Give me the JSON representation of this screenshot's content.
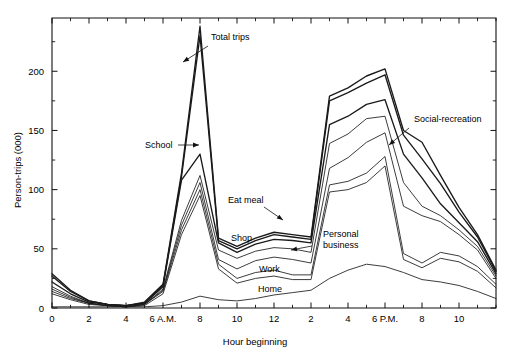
{
  "chart_data": {
    "type": "line",
    "title": "",
    "xlabel": "Hour beginning",
    "ylabel": "Person-trips (000)",
    "xlim": [
      0,
      24
    ],
    "ylim": [
      0,
      245
    ],
    "grid": false,
    "legend_position": "inline-annotations",
    "x": [
      0,
      1,
      2,
      3,
      4,
      5,
      6,
      7,
      8,
      9,
      10,
      11,
      12,
      13,
      14,
      15,
      16,
      17,
      18,
      19,
      20,
      21,
      22,
      23,
      24
    ],
    "x_tick_labels": [
      "0",
      "2",
      "4",
      "6 A.M.",
      "8",
      "10",
      "12",
      "2",
      "4",
      "6 P.M.",
      "8",
      "10"
    ],
    "x_tick_values": [
      0,
      2,
      4,
      6,
      8,
      10,
      12,
      14,
      16,
      18,
      20,
      22
    ],
    "y_tick_labels": [
      "0",
      "50",
      "100",
      "150",
      "200"
    ],
    "y_tick_values": [
      0,
      50,
      100,
      150,
      200
    ],
    "series": [
      {
        "name": "Home",
        "label": "Home",
        "values": [
          1,
          1,
          1,
          1,
          1,
          1,
          2,
          5,
          10,
          7,
          6,
          8,
          11,
          13,
          15,
          25,
          32,
          37,
          35,
          30,
          24,
          22,
          19,
          14,
          8
        ]
      },
      {
        "name": "Work",
        "label": "Work",
        "values": [
          12,
          7,
          3,
          2,
          1,
          2,
          12,
          62,
          95,
          33,
          21,
          25,
          27,
          24,
          24,
          98,
          100,
          106,
          120,
          41,
          34,
          42,
          39,
          31,
          17
        ]
      },
      {
        "name": "Personal business",
        "label": "Personal business",
        "values": [
          14,
          8,
          4,
          2,
          1,
          3,
          14,
          66,
          100,
          37,
          25,
          30,
          32,
          28,
          28,
          104,
          107,
          114,
          128,
          46,
          38,
          47,
          44,
          35,
          20
        ]
      },
      {
        "name": "Shop",
        "label": "Shop",
        "values": [
          16,
          9,
          4,
          2,
          1,
          3,
          15,
          70,
          106,
          41,
          33,
          40,
          43,
          41,
          38,
          118,
          127,
          140,
          148,
          86,
          78,
          73,
          62,
          49,
          25
        ]
      },
      {
        "name": "Eat meal",
        "label": "Eat meal",
        "values": [
          18,
          10,
          4,
          2,
          1,
          3,
          16,
          74,
          112,
          49,
          42,
          48,
          51,
          50,
          47,
          139,
          147,
          160,
          162,
          106,
          86,
          78,
          66,
          52,
          27
        ]
      },
      {
        "name": "School",
        "label": "School",
        "values": [
          22,
          12,
          5,
          3,
          2,
          4,
          18,
          108,
          130,
          55,
          47,
          54,
          58,
          57,
          55,
          155,
          162,
          172,
          176,
          130,
          110,
          88,
          72,
          56,
          29
        ]
      },
      {
        "name": "Social-recreation",
        "label": "Social-recreation",
        "values": [
          27,
          14,
          6,
          3,
          2,
          4,
          19,
          111,
          230,
          57,
          50,
          57,
          62,
          60,
          58,
          175,
          182,
          190,
          197,
          146,
          126,
          105,
          81,
          60,
          31
        ]
      },
      {
        "name": "Total trips",
        "label": "Total trips",
        "values": [
          29,
          15,
          6,
          3,
          2,
          5,
          20,
          114,
          238,
          59,
          52,
          59,
          64,
          62,
          60,
          179,
          186,
          196,
          202,
          150,
          140,
          112,
          85,
          62,
          32
        ]
      }
    ],
    "annotations": [
      {
        "text": "Total trips",
        "x_px": 211,
        "y_px": 40
      },
      {
        "text": "School",
        "x_px": 145,
        "y_px": 148
      },
      {
        "text": "Eat meal",
        "x_px": 228,
        "y_px": 203
      },
      {
        "text": "Shop",
        "x_px": 231,
        "y_px": 241
      },
      {
        "text": "Personal",
        "x_px": 323,
        "y_px": 237
      },
      {
        "text": "business",
        "x_px": 323,
        "y_px": 248
      },
      {
        "text": "Work",
        "x_px": 259,
        "y_px": 272
      },
      {
        "text": "Home",
        "x_px": 258,
        "y_px": 292
      },
      {
        "text": "Social-recreation",
        "x_px": 414,
        "y_px": 122
      }
    ]
  },
  "figure": {
    "background_color": "#ffffff",
    "line_color": "#1a1a1a",
    "axis_color": "#111111"
  }
}
